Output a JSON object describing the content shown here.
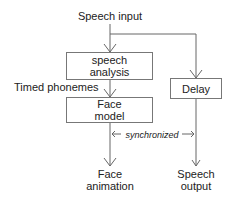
{
  "diagram": {
    "input_label": "Speech input",
    "boxes": {
      "speech_analysis": "speech analysis",
      "speech_analysis_line1": "speech",
      "speech_analysis_line2": "analysis",
      "face_model_line1": "Face",
      "face_model_line2": "model",
      "delay": "Delay"
    },
    "edge_labels": {
      "timed_phonemes": "Timed phonemes",
      "synchronized": "synchronized"
    },
    "outputs": {
      "face_animation_line1": "Face",
      "face_animation_line2": "animation",
      "speech_output_line1": "Speech",
      "speech_output_line2": "output"
    },
    "colors": {
      "line": "#666666",
      "text": "#222222"
    }
  }
}
